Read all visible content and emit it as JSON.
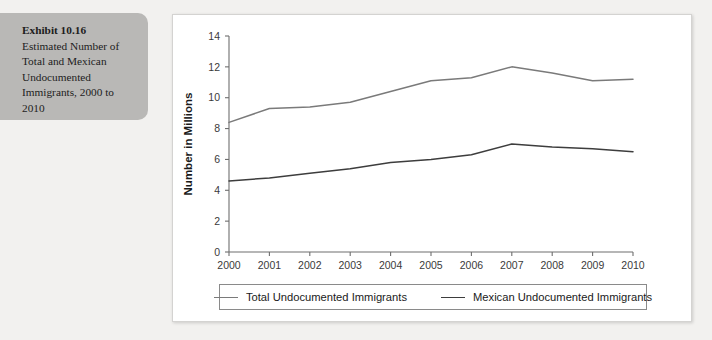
{
  "caption": {
    "lead": "Exhibit 10.16",
    "body": "Estimated Number of Total and Mexican Undocumented Immigrants, 2000 to 2010"
  },
  "colors": {
    "panel_background": "#ffffff",
    "page_background": "#f2f1ef",
    "caption_background": "#b9b8b6",
    "total_series": "#7a7a7a",
    "mexican_series": "#3d3d3d",
    "axis": "#6e6e6e"
  },
  "legend": {
    "position": "bottom",
    "entries": [
      {
        "label": "Total Undocumented Immigrants",
        "color": "#7a7a7a"
      },
      {
        "label": "Mexican Undocumented Immigrants",
        "color": "#3d3d3d"
      }
    ]
  },
  "chart_data": {
    "type": "line",
    "title": "",
    "xlabel": "",
    "ylabel": "Number in Millions",
    "ylim": [
      0,
      14
    ],
    "yticks": [
      0,
      2,
      4,
      6,
      8,
      10,
      12,
      14
    ],
    "ytick_labels": [
      "0",
      "2",
      "4",
      "6",
      "8",
      "10",
      "12",
      "14"
    ],
    "grid": false,
    "categories": [
      2000,
      2001,
      2002,
      2003,
      2004,
      2005,
      2006,
      2007,
      2008,
      2009,
      2010
    ],
    "xtick_labels": [
      "2000",
      "2001",
      "2002",
      "2003",
      "2004",
      "2005",
      "2006",
      "2007",
      "2008",
      "2009",
      "2010"
    ],
    "series": [
      {
        "name": "Total Undocumented Immigrants",
        "color": "#7a7a7a",
        "values": [
          8.4,
          9.3,
          9.4,
          9.7,
          10.4,
          11.1,
          11.3,
          12.0,
          11.6,
          11.1,
          11.2
        ]
      },
      {
        "name": "Mexican Undocumented Immigrants",
        "color": "#3d3d3d",
        "values": [
          4.6,
          4.8,
          5.1,
          5.4,
          5.8,
          6.0,
          6.3,
          7.0,
          6.8,
          6.7,
          6.5
        ]
      }
    ]
  }
}
